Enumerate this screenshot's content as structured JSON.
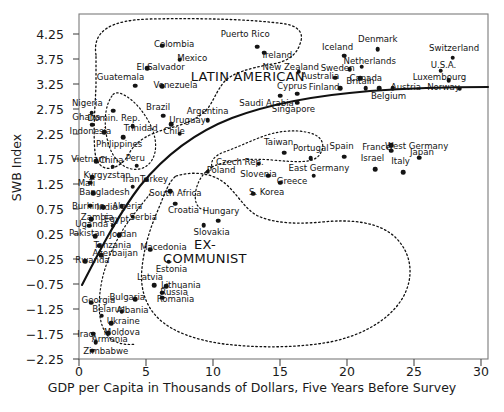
{
  "chart_data": {
    "type": "scatter",
    "title": "",
    "xlabel": "GDP per Capita in Thousands of Dollars, Five Years Before Survey",
    "ylabel": "SWB Index",
    "xlim": [
      0,
      30.5
    ],
    "ylim": [
      -2.25,
      4.5
    ],
    "xticks": [
      0,
      5,
      10,
      15,
      20,
      25,
      30
    ],
    "yticks": [
      "4.25",
      "3.75",
      "3.25",
      "2.75",
      "2.25",
      "1.75",
      "1.25",
      "0.75",
      "0.25",
      "−0.25",
      "−0.75",
      "−1.25",
      "−1.75",
      "−2.25"
    ],
    "grid": false,
    "legend": "none",
    "annotations": [
      {
        "text": "LATIN AMERICAN",
        "x": 12.6,
        "y": 3.42,
        "lines": [
          "LATIN AMERICAN"
        ]
      },
      {
        "text": "EX-COMMUNIST",
        "x": 9.4,
        "y": -0.1,
        "lines": [
          "EX-",
          "COMMUNIST"
        ]
      }
    ],
    "points": [
      {
        "label": "Colombia",
        "x": 6.2,
        "y": 4.02,
        "lx": 7.1,
        "ly": 4.04
      },
      {
        "label": "Mexico",
        "x": 7.5,
        "y": 3.74,
        "lx": 8.45,
        "ly": 3.76
      },
      {
        "label": "El Salvador",
        "x": 5.1,
        "y": 3.57,
        "lx": 6.1,
        "ly": 3.58
      },
      {
        "label": "Guatemala",
        "x": 4.2,
        "y": 3.22,
        "lx": 3.1,
        "ly": 3.38
      },
      {
        "label": "Venezuela",
        "x": 6.2,
        "y": 3.21,
        "lx": 7.2,
        "ly": 3.22
      },
      {
        "label": "Saudi Arabia",
        "x": 15.0,
        "y": 3.02,
        "lx": 14.0,
        "ly": 2.86
      },
      {
        "label": "Nigeria",
        "x": 0.95,
        "y": 2.68,
        "lx": 0.62,
        "ly": 2.85
      },
      {
        "label": "Domin. Rep.",
        "x": 2.55,
        "y": 2.72,
        "lx": 2.6,
        "ly": 2.56
      },
      {
        "label": "Brazil",
        "x": 6.3,
        "y": 2.62,
        "lx": 5.9,
        "ly": 2.78
      },
      {
        "label": "Argentina",
        "x": 9.6,
        "y": 2.53,
        "lx": 9.6,
        "ly": 2.69
      },
      {
        "label": "Ghana",
        "x": 1.0,
        "y": 2.44,
        "lx": 0.55,
        "ly": 2.57
      },
      {
        "label": "Uruguay",
        "x": 6.9,
        "y": 2.45,
        "lx": 8.1,
        "ly": 2.52
      },
      {
        "label": "Trinidad",
        "x": 4.0,
        "y": 2.41,
        "lx": 4.6,
        "ly": 2.36
      },
      {
        "label": "Indonesia",
        "x": 1.9,
        "y": 2.29,
        "lx": 0.85,
        "ly": 2.3
      },
      {
        "label": "Chile",
        "x": 7.5,
        "y": 2.26,
        "lx": 7.1,
        "ly": 2.3
      },
      {
        "label": "Philippines",
        "x": 3.3,
        "y": 2.19,
        "lx": 3.0,
        "ly": 2.04
      },
      {
        "label": "Taiwan",
        "x": 15.3,
        "y": 1.88,
        "lx": 14.9,
        "ly": 2.07
      },
      {
        "label": "Portugal",
        "x": 17.3,
        "y": 1.77,
        "lx": 17.3,
        "ly": 1.96
      },
      {
        "label": "Spain",
        "x": 19.8,
        "y": 1.8,
        "lx": 19.6,
        "ly": 1.99
      },
      {
        "label": "Israel",
        "x": 22.1,
        "y": 1.55,
        "lx": 21.9,
        "ly": 1.76
      },
      {
        "label": "Italy",
        "x": 24.2,
        "y": 1.49,
        "lx": 24.0,
        "ly": 1.7
      },
      {
        "label": "France",
        "x": 23.3,
        "y": 1.92,
        "lx": 22.2,
        "ly": 1.97
      },
      {
        "label": "West Germany",
        "x": 23.3,
        "y": 2.03,
        "lx": 25.2,
        "ly": 2.0
      },
      {
        "label": "Japan",
        "x": 25.4,
        "y": 1.78,
        "lx": 25.6,
        "ly": 1.88
      },
      {
        "label": "Czech Rep.",
        "x": 13.4,
        "y": 1.66,
        "lx": 12.0,
        "ly": 1.67
      },
      {
        "label": "Vietnam",
        "x": 1.3,
        "y": 1.71,
        "lx": 0.75,
        "ly": 1.73
      },
      {
        "label": "China",
        "x": 2.5,
        "y": 1.6,
        "lx": 2.4,
        "ly": 1.72
      },
      {
        "label": "Peru",
        "x": 4.3,
        "y": 1.62,
        "lx": 4.2,
        "ly": 1.75
      },
      {
        "label": "Poland",
        "x": 9.6,
        "y": 1.5,
        "lx": 10.6,
        "ly": 1.52
      },
      {
        "label": "Slovenia",
        "x": 14.1,
        "y": 1.42,
        "lx": 13.4,
        "ly": 1.44
      },
      {
        "label": "East Germany",
        "x": 17.5,
        "y": 1.42,
        "lx": 17.9,
        "ly": 1.56
      },
      {
        "label": "Greece",
        "x": 15.0,
        "y": 1.28,
        "lx": 15.9,
        "ly": 1.29
      },
      {
        "label": "Kyrgyzstan",
        "x": 1.0,
        "y": 1.39,
        "lx": 2.1,
        "ly": 1.42
      },
      {
        "label": "Mali",
        "x": 0.85,
        "y": 1.28,
        "lx": 0.55,
        "ly": 1.25
      },
      {
        "label": "Iran",
        "x": 4.0,
        "y": 1.2,
        "lx": 3.9,
        "ly": 1.33
      },
      {
        "label": "Turkey",
        "x": 5.0,
        "y": 1.34,
        "lx": 5.6,
        "ly": 1.33
      },
      {
        "label": "S. Korea",
        "x": 13.0,
        "y": 1.06,
        "lx": 14.0,
        "ly": 1.07
      },
      {
        "label": "Bangladesh",
        "x": 1.05,
        "y": 1.07,
        "lx": 1.9,
        "ly": 1.07
      },
      {
        "label": "South Africa",
        "x": 6.8,
        "y": 1.11,
        "lx": 7.2,
        "ly": 1.06
      },
      {
        "label": "Burkina",
        "x": 0.85,
        "y": 0.82,
        "lx": 0.7,
        "ly": 0.8
      },
      {
        "label": "India",
        "x": 1.8,
        "y": 0.79,
        "lx": 2.1,
        "ly": 0.78
      },
      {
        "label": "Algeria",
        "x": 3.2,
        "y": 0.81,
        "lx": 3.6,
        "ly": 0.79
      },
      {
        "label": "Croatia",
        "x": 7.2,
        "y": 0.86,
        "lx": 7.8,
        "ly": 0.71
      },
      {
        "label": "Zambia",
        "x": 0.9,
        "y": 0.55,
        "lx": 1.35,
        "ly": 0.57
      },
      {
        "label": "Serbia",
        "x": 4.0,
        "y": 0.6,
        "lx": 4.8,
        "ly": 0.57
      },
      {
        "label": "Hungary",
        "x": 10.4,
        "y": 0.52,
        "lx": 10.6,
        "ly": 0.7
      },
      {
        "label": "Uganda",
        "x": 0.75,
        "y": 0.42,
        "lx": 0.95,
        "ly": 0.44
      },
      {
        "label": "Egypt",
        "x": 2.5,
        "y": 0.42,
        "lx": 2.8,
        "ly": 0.53
      },
      {
        "label": "Slovakia",
        "x": 9.3,
        "y": 0.43,
        "lx": 9.9,
        "ly": 0.28
      },
      {
        "label": "Pakistan",
        "x": 1.2,
        "y": 0.21,
        "lx": 0.6,
        "ly": 0.26
      },
      {
        "label": "Jordan",
        "x": 3.0,
        "y": 0.23,
        "lx": 3.3,
        "ly": 0.23
      },
      {
        "label": "Tanzania",
        "x": 1.5,
        "y": 0.02,
        "lx": 2.5,
        "ly": 0.02
      },
      {
        "label": "Macedonia",
        "x": 5.3,
        "y": -0.06,
        "lx": 6.3,
        "ly": -0.03
      },
      {
        "label": "Azerbaijan",
        "x": 1.65,
        "y": -0.17,
        "lx": 2.7,
        "ly": -0.14
      },
      {
        "label": "Rwanda",
        "x": 0.45,
        "y": -0.29,
        "lx": 1.0,
        "ly": -0.29
      },
      {
        "label": "Estonia",
        "x": 6.7,
        "y": -0.3,
        "lx": 6.9,
        "ly": -0.47
      },
      {
        "label": "Latvia",
        "x": 5.6,
        "y": -0.77,
        "lx": 5.3,
        "ly": -0.62
      },
      {
        "label": "Lithuania",
        "x": 6.5,
        "y": -0.79,
        "lx": 7.6,
        "ly": -0.79
      },
      {
        "label": "Russia",
        "x": 6.2,
        "y": -0.92,
        "lx": 7.1,
        "ly": -0.92
      },
      {
        "label": "Romania",
        "x": 6.2,
        "y": -1.02,
        "lx": 7.2,
        "ly": -1.07
      },
      {
        "label": "Bulgaria",
        "x": 4.2,
        "y": -1.05,
        "lx": 3.6,
        "ly": -1.03
      },
      {
        "label": "Georgia",
        "x": 0.9,
        "y": -1.12,
        "lx": 1.45,
        "ly": -1.09
      },
      {
        "label": "Albania",
        "x": 3.2,
        "y": -1.3,
        "lx": 4.0,
        "ly": -1.29
      },
      {
        "label": "Belarus",
        "x": 1.7,
        "y": -1.38,
        "lx": 2.2,
        "ly": -1.27
      },
      {
        "label": "Ukraine",
        "x": 2.4,
        "y": -1.53,
        "lx": 3.3,
        "ly": -1.51
      },
      {
        "label": "Moldova",
        "x": 2.2,
        "y": -1.73,
        "lx": 3.2,
        "ly": -1.72
      },
      {
        "label": "Iraq",
        "x": 1.05,
        "y": -1.74,
        "lx": 0.5,
        "ly": -1.76
      },
      {
        "label": "Armenia",
        "x": 1.25,
        "y": -1.91,
        "lx": 2.3,
        "ly": -1.87
      },
      {
        "label": "Zimbabwe",
        "x": 1.0,
        "y": -2.08,
        "lx": 2.0,
        "ly": -2.11
      },
      {
        "label": "Puerto Rico",
        "x": 13.3,
        "y": 4.0,
        "lx": 12.4,
        "ly": 4.23
      },
      {
        "label": "Ireland",
        "x": 13.8,
        "y": 3.88,
        "lx": 14.8,
        "ly": 3.82
      },
      {
        "label": "Iceland",
        "x": 19.8,
        "y": 3.82,
        "lx": 19.3,
        "ly": 3.97
      },
      {
        "label": "Denmark",
        "x": 22.3,
        "y": 3.95,
        "lx": 22.3,
        "ly": 4.13
      },
      {
        "label": "Switzerland",
        "x": 27.9,
        "y": 3.78,
        "lx": 28.0,
        "ly": 3.95
      },
      {
        "label": "Netherlands",
        "x": 21.1,
        "y": 3.6,
        "lx": 21.7,
        "ly": 3.7
      },
      {
        "label": "Sweden",
        "x": 20.2,
        "y": 3.55,
        "lx": 19.3,
        "ly": 3.56
      },
      {
        "label": "U.S.A.",
        "x": 27.0,
        "y": 3.52,
        "lx": 27.2,
        "ly": 3.62
      },
      {
        "label": "New Zealand",
        "x": 16.4,
        "y": 3.5,
        "lx": 15.8,
        "ly": 3.58
      },
      {
        "label": "Australia",
        "x": 19.1,
        "y": 3.38,
        "lx": 18.0,
        "ly": 3.39
      },
      {
        "label": "Canada",
        "x": 21.0,
        "y": 3.37,
        "lx": 21.4,
        "ly": 3.35
      },
      {
        "label": "Luxembourg",
        "x": 27.6,
        "y": 3.33,
        "lx": 26.9,
        "ly": 3.37
      },
      {
        "label": "Finland",
        "x": 19.5,
        "y": 3.17,
        "lx": 18.3,
        "ly": 3.17
      },
      {
        "label": "Britain",
        "x": 21.4,
        "y": 3.17,
        "lx": 21.0,
        "ly": 3.3
      },
      {
        "label": "Cyprus",
        "x": 16.3,
        "y": 3.06,
        "lx": 15.9,
        "ly": 3.2
      },
      {
        "label": "Belgium",
        "x": 22.4,
        "y": 3.17,
        "lx": 23.1,
        "ly": 3.0
      },
      {
        "label": "Austria",
        "x": 23.4,
        "y": 3.17,
        "lx": 24.4,
        "ly": 3.18
      },
      {
        "label": "Norway",
        "x": 28.4,
        "y": 3.16,
        "lx": 27.2,
        "ly": 3.18
      },
      {
        "label": "Singapore",
        "x": 16.3,
        "y": 2.88,
        "lx": 16.0,
        "ly": 2.73
      }
    ],
    "curves": [
      {
        "name": "regression-curve",
        "style": "solid"
      },
      {
        "name": "latin-american-boundary",
        "style": "dotted"
      },
      {
        "name": "ex-communist-boundary",
        "style": "dotted"
      },
      {
        "name": "developing-boundary",
        "style": "dotted"
      },
      {
        "name": "southern-europe-boundary",
        "style": "dotted"
      }
    ]
  }
}
